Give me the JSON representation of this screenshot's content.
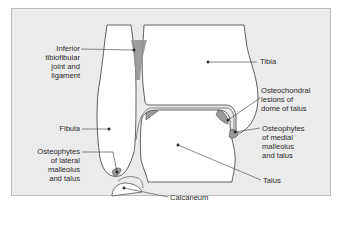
{
  "diagram": {
    "colors": {
      "background": "#ebebeb",
      "bone_fill": "#ffffff",
      "outline": "#3a3a3a",
      "joint_space_fill": "#c9c9c9",
      "osteophyte_fill": "#9a9a9a"
    },
    "labels": {
      "inferior_tibiofibular": [
        "Inferior",
        "tibiofibular",
        "joint and",
        "ligament"
      ],
      "tibia": [
        "Tibia"
      ],
      "osteochondral": [
        "Osteochondral",
        "lesions of",
        "dome of talus"
      ],
      "fibula": [
        "Fibula"
      ],
      "osteophytes_lateral": [
        "Osteophytes",
        "of lateral",
        "malleolus",
        "and talus"
      ],
      "osteophytes_medial": [
        "Osteophytes",
        "of medial",
        "malleolus",
        "and talus"
      ],
      "talus": [
        "Talus"
      ],
      "calcaneum": [
        "Calcaneum"
      ]
    }
  }
}
